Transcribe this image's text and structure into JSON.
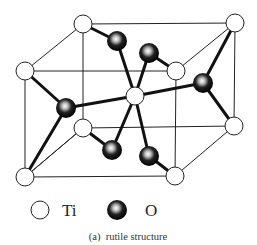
{
  "figure": {
    "caption": "(a)  rutile structure",
    "legend": [
      {
        "symbol": "ti-atom",
        "label": "Ti"
      },
      {
        "symbol": "o-atom",
        "label": "O"
      }
    ]
  },
  "structure": {
    "name": "rutile",
    "ti_atoms": [
      {
        "id": "ti-top-back-left",
        "x": 83,
        "y": 24
      },
      {
        "id": "ti-top-back-right",
        "x": 235,
        "y": 23
      },
      {
        "id": "ti-top-front-left",
        "x": 25,
        "y": 71
      },
      {
        "id": "ti-top-front-right",
        "x": 176,
        "y": 71
      },
      {
        "id": "ti-center",
        "x": 135,
        "y": 96
      },
      {
        "id": "ti-bottom-back-left",
        "x": 83,
        "y": 128
      },
      {
        "id": "ti-bottom-back-right",
        "x": 234,
        "y": 126
      },
      {
        "id": "ti-bottom-front-left",
        "x": 25,
        "y": 177
      },
      {
        "id": "ti-bottom-front-right",
        "x": 175,
        "y": 176
      }
    ],
    "o_atoms": [
      {
        "id": "o-1",
        "x": 117,
        "y": 41
      },
      {
        "id": "o-2",
        "x": 149,
        "y": 53
      },
      {
        "id": "o-3",
        "x": 66,
        "y": 108
      },
      {
        "id": "o-4",
        "x": 203,
        "y": 83
      },
      {
        "id": "o-5",
        "x": 112,
        "y": 150
      },
      {
        "id": "o-6",
        "x": 149,
        "y": 156
      }
    ],
    "colors": {
      "ti_fill": "#ffffff",
      "o_fill": "#111111",
      "line": "#222222"
    }
  }
}
